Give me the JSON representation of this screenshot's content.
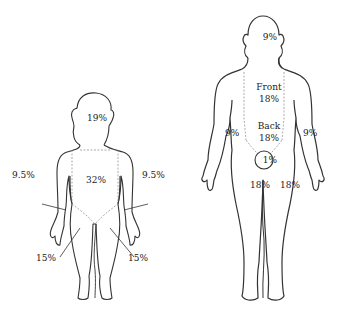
{
  "diagram": {
    "type": "rule-of-nines burn chart",
    "colors": {
      "outline": "#333333",
      "region_line": "#888888",
      "text": "#222222",
      "background": "#ffffff"
    },
    "child": {
      "labels": {
        "head": "19%",
        "trunk": "32%",
        "left_arm": "9.5%",
        "right_arm": "9.5%",
        "left_leg": "15%",
        "right_leg": "15%"
      }
    },
    "adult": {
      "labels": {
        "head": "9%",
        "front_title": "Front",
        "front_value": "18%",
        "back_title": "Back",
        "back_value": "18%",
        "left_arm": "9%",
        "right_arm": "9%",
        "perineum": "1%",
        "left_leg": "18%",
        "right_leg": "18%"
      }
    }
  }
}
